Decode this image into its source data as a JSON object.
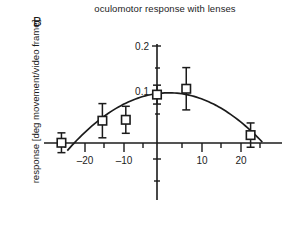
{
  "figure": {
    "panel_label": "B",
    "title": "oculomotor response with lenses",
    "ylabel": "response [deg movement/video frame]"
  },
  "chart_data": {
    "type": "scatter",
    "title": "oculomotor response with lenses",
    "panel": "B",
    "xlabel": "",
    "ylabel": "response [deg movement/video frame]",
    "xlim": [
      -30,
      30
    ],
    "ylim": [
      -0.11,
      0.21
    ],
    "grid": false,
    "legend": null,
    "xticks": [
      -20,
      -10,
      10,
      20
    ],
    "xtick_labels": [
      "–20",
      "–10",
      "10",
      "20"
    ],
    "xticks_minor": [
      -25,
      -15,
      -5,
      5,
      15,
      25
    ],
    "yticks": [
      0.1,
      0.2
    ],
    "ytick_labels": [
      "0.1",
      "0.2"
    ],
    "yticks_minor": [
      0.05,
      0.15,
      -0.05,
      -0.1
    ],
    "marker": "open-square",
    "errorbar": "symmetric-vertical",
    "points": [
      {
        "x": -24.5,
        "y": -0.015,
        "yerr": 0.022
      },
      {
        "x": -14.0,
        "y": 0.034,
        "yerr": 0.038
      },
      {
        "x": -8.0,
        "y": 0.036,
        "yerr": 0.03
      },
      {
        "x": 0.0,
        "y": 0.092,
        "yerr": 0.021
      },
      {
        "x": 7.5,
        "y": 0.105,
        "yerr": 0.047
      },
      {
        "x": 24.0,
        "y": 0.002,
        "yerr": 0.027
      }
    ],
    "fit_curve": {
      "type": "parabola",
      "description": "quadratic fit peaking just right of zero",
      "vertex_x": 3.0,
      "vertex_y": 0.096,
      "x_start": -23.0,
      "x_end": 27.0,
      "a": -0.00019
    }
  }
}
